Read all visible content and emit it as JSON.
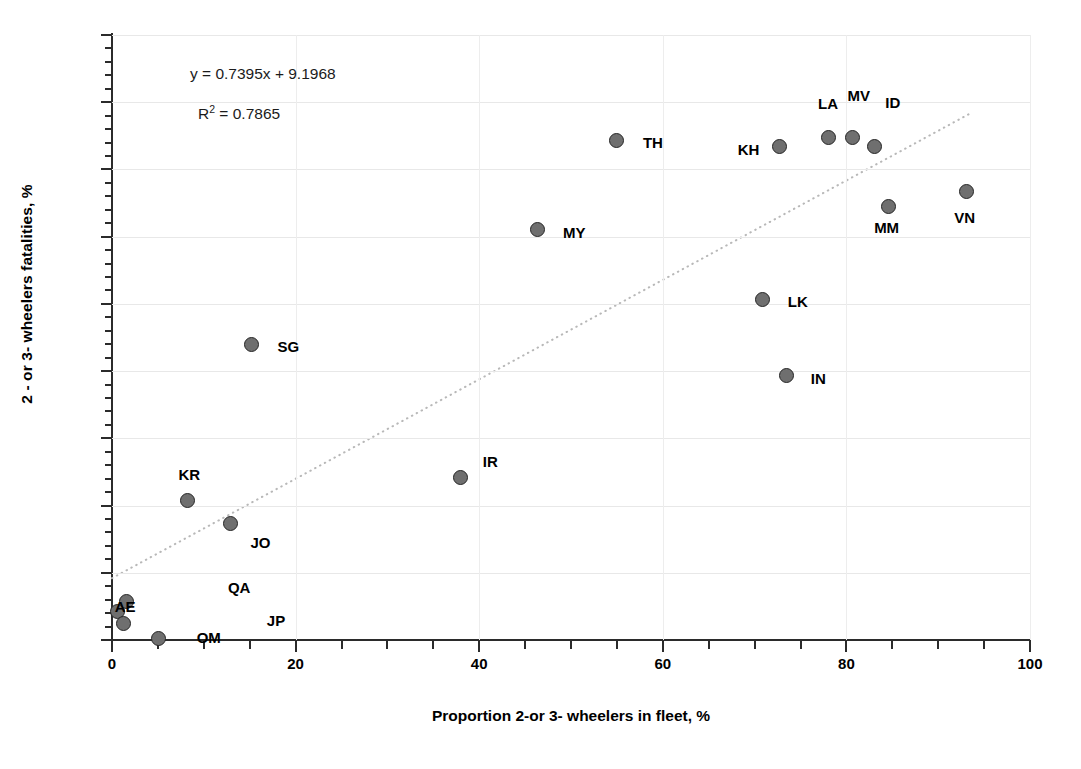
{
  "chart_data": {
    "type": "scatter",
    "title": "",
    "xlabel": "Proportion 2-or 3- wheelers in fleet, %",
    "ylabel": "2 - or 3- wheelers fatalities, %",
    "xlim": [
      0,
      100
    ],
    "ylim": [
      0,
      90
    ],
    "xticks": [
      0,
      20,
      40,
      60,
      80,
      100
    ],
    "yticks": [
      0,
      10,
      20,
      30,
      40,
      50,
      60,
      70,
      80,
      90
    ],
    "x_minor_step": 5,
    "y_minor_step": 2,
    "grid": "both-faint",
    "legend": "none",
    "marker_color": "#6f6f6f",
    "marker_edge_color": "#262626",
    "trendline": {
      "style": "dotted",
      "color": "#b8b8b8",
      "equation": "y = 0.7395x + 9.1968",
      "r2_text": "R² = 0.7865",
      "slope": 0.7395,
      "intercept": 9.1968,
      "r2": 0.7865,
      "x_start": 0,
      "x_end": 93.5
    },
    "points": [
      {
        "label": "AE",
        "x": 0.6,
        "y": 4.3,
        "lx": 18,
        "ly": -4,
        "anchor": "right"
      },
      {
        "label": "OM",
        "x": 1.6,
        "y": 5.7,
        "lx": 70,
        "ly": 36,
        "anchor": "left"
      },
      {
        "label": "QA",
        "x": 1.3,
        "y": 2.4,
        "lx": 104,
        "ly": -36,
        "anchor": "left"
      },
      {
        "label": "JP",
        "x": 5.1,
        "y": 0.2,
        "lx": 108,
        "ly": -18,
        "anchor": "left"
      },
      {
        "label": "KR",
        "x": 8.2,
        "y": 20.7,
        "lx": 2,
        "ly": -26,
        "anchor": "center"
      },
      {
        "label": "JO",
        "x": 12.9,
        "y": 17.4,
        "lx": 20,
        "ly": 20,
        "anchor": "left"
      },
      {
        "label": "SG",
        "x": 15.2,
        "y": 43.9,
        "lx": 26,
        "ly": 2,
        "anchor": "left"
      },
      {
        "label": "IR",
        "x": 38.0,
        "y": 24.1,
        "lx": 22,
        "ly": -16,
        "anchor": "left"
      },
      {
        "label": "MY",
        "x": 46.3,
        "y": 61.0,
        "lx": 26,
        "ly": 3,
        "anchor": "left"
      },
      {
        "label": "TH",
        "x": 55.0,
        "y": 74.3,
        "lx": 26,
        "ly": 2,
        "anchor": "left"
      },
      {
        "label": "LK",
        "x": 70.9,
        "y": 50.7,
        "lx": 25,
        "ly": 3,
        "anchor": "left"
      },
      {
        "label": "KH",
        "x": 72.7,
        "y": 73.4,
        "lx": -20,
        "ly": 3,
        "anchor": "right"
      },
      {
        "label": "IN",
        "x": 73.5,
        "y": 39.4,
        "lx": 24,
        "ly": 4,
        "anchor": "left"
      },
      {
        "label": "LA",
        "x": 78.0,
        "y": 74.8,
        "lx": 0,
        "ly": -33,
        "anchor": "center"
      },
      {
        "label": "MV",
        "x": 80.7,
        "y": 74.8,
        "lx": 6,
        "ly": -41,
        "anchor": "center"
      },
      {
        "label": "ID",
        "x": 83.1,
        "y": 73.4,
        "lx": 18,
        "ly": -44,
        "anchor": "center"
      },
      {
        "label": "MM",
        "x": 84.6,
        "y": 64.5,
        "lx": -2,
        "ly": 22,
        "anchor": "center"
      },
      {
        "label": "VN",
        "x": 93.1,
        "y": 66.7,
        "lx": -2,
        "ly": 26,
        "anchor": "center"
      }
    ]
  }
}
